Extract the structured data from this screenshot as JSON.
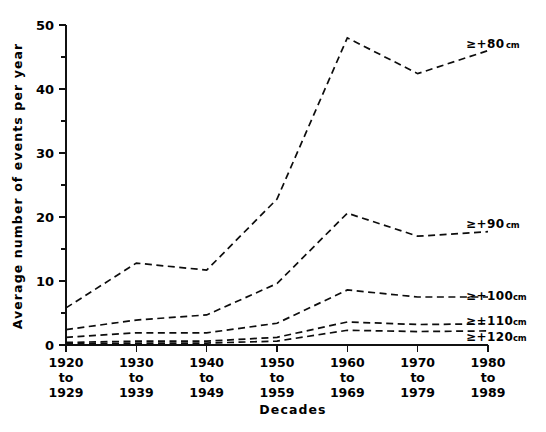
{
  "chart_data": {
    "type": "line",
    "title": "",
    "xlabel": "Decades",
    "ylabel": "Average number of events per year",
    "categories": [
      "1920 to 1929",
      "1930 to 1939",
      "1940 to 1949",
      "1950 to 1959",
      "1960 to 1969",
      "1970 to 1979",
      "1980 to 1989"
    ],
    "x_tick_lines": [
      [
        "1920",
        "to",
        "1929"
      ],
      [
        "1930",
        "to",
        "1939"
      ],
      [
        "1940",
        "to",
        "1949"
      ],
      [
        "1950",
        "to",
        "1959"
      ],
      [
        "1960",
        "to",
        "1969"
      ],
      [
        "1970",
        "to",
        "1979"
      ],
      [
        "1980",
        "to",
        "1989"
      ]
    ],
    "ylim": [
      0,
      50
    ],
    "y_major_ticks": [
      0,
      10,
      20,
      30,
      40,
      50
    ],
    "y_minor_ticks": [
      5,
      15,
      25,
      35,
      45
    ],
    "y_tick_labels": [
      "0",
      "10",
      "20",
      "30",
      "40",
      "50"
    ],
    "grid": false,
    "legend_position": "right-inline",
    "line_style": "dashed",
    "line_color": "#0d0d0d",
    "series": [
      {
        "name": "≥+80 cm",
        "label_main": "≥+80",
        "label_unit": "cm",
        "values": [
          5.8,
          12.8,
          11.7,
          22.8,
          48.0,
          42.4,
          46.0
        ]
      },
      {
        "name": "≥+90 cm",
        "label_main": "≥+90",
        "label_unit": "cm",
        "values": [
          2.4,
          3.9,
          4.7,
          9.6,
          20.6,
          17.0,
          17.7
        ]
      },
      {
        "name": "≥+100 cm",
        "label_main": "≥+100",
        "label_unit": "cm",
        "values": [
          1.2,
          1.9,
          1.9,
          3.4,
          8.6,
          7.5,
          7.5
        ]
      },
      {
        "name": "≥+110 cm",
        "label_main": "≥+110",
        "label_unit": "cm",
        "values": [
          0.4,
          0.6,
          0.6,
          1.2,
          3.6,
          3.2,
          3.3
        ]
      },
      {
        "name": "≥+120 cm",
        "label_main": "≥+120",
        "label_unit": "cm",
        "values": [
          0.2,
          0.3,
          0.3,
          0.6,
          2.3,
          2.1,
          2.2
        ]
      }
    ],
    "series_label_positions": [
      {
        "x": 466,
        "y": 48
      },
      {
        "x": 466,
        "y": 228
      },
      {
        "x": 466,
        "y": 300
      },
      {
        "x": 466,
        "y": 325
      },
      {
        "x": 466,
        "y": 341
      }
    ]
  }
}
